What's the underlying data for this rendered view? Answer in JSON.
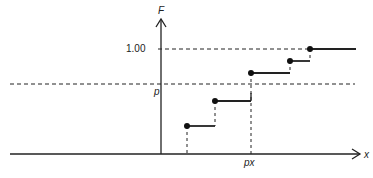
{
  "diagram": {
    "type": "step-function-cdf",
    "labels": {
      "y_axis": "F",
      "x_axis": "x",
      "level_one": "1.00",
      "level_p": "p",
      "x_quantile": "px"
    },
    "colors": {
      "ink": "#222222",
      "background": "#ffffff"
    },
    "steps": [
      {
        "x_start": 187,
        "x_end": 215,
        "y": 126
      },
      {
        "x_start": 215,
        "x_end": 251,
        "y": 101
      },
      {
        "x_start": 251,
        "x_end": 290,
        "y": 73
      },
      {
        "x_start": 290,
        "x_end": 310,
        "y": 61
      },
      {
        "x_start": 310,
        "x_end": 356,
        "y": 49
      }
    ]
  }
}
